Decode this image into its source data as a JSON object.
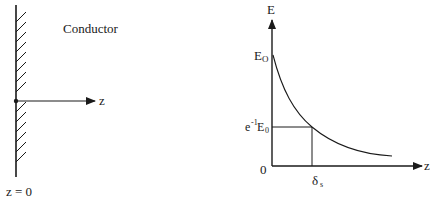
{
  "left_figure": {
    "conductor_label": "Conductor",
    "axis_label": "z",
    "origin_label": "z = 0"
  },
  "right_figure": {
    "y_axis_label": "E",
    "x_axis_label": "z",
    "e0_label_main": "E",
    "e0_label_sub": "O",
    "e1_label_base": "e",
    "e1_label_sup": "-1",
    "e1_label_E": "E",
    "e1_label_sub": "0",
    "origin_label": "0",
    "delta_label_main": "δ",
    "delta_label_sub": "s"
  },
  "colors": {
    "ink": "#1a1a1a",
    "background": "#ffffff"
  }
}
